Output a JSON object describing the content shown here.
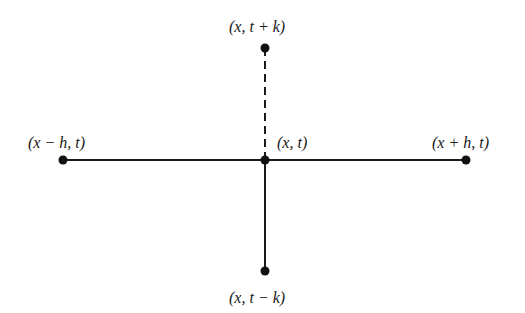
{
  "diagram": {
    "title": "",
    "style": {
      "line_color": "#1a1a1a",
      "dot_color": "#111111",
      "background": "#ffffff"
    },
    "nodes": [
      {
        "id": "center",
        "label": "(x, t)",
        "x": 265,
        "y": 160,
        "label_x": 277,
        "label_y": 135
      },
      {
        "id": "left",
        "label": "(x − h, t)",
        "x": 63,
        "y": 160,
        "label_x": 28,
        "label_y": 135
      },
      {
        "id": "right",
        "label": "(x + h, t)",
        "x": 466,
        "y": 160,
        "label_x": 432,
        "label_y": 135
      },
      {
        "id": "top",
        "label": "(x, t + k)",
        "x": 265,
        "y": 48,
        "label_x": 229,
        "label_y": 19
      },
      {
        "id": "bottom",
        "label": "(x, t − k)",
        "x": 265,
        "y": 271,
        "label_x": 229,
        "label_y": 290
      }
    ],
    "edges": [
      {
        "from": "left",
        "to": "center",
        "style": "solid"
      },
      {
        "from": "center",
        "to": "right",
        "style": "solid"
      },
      {
        "from": "center",
        "to": "bottom",
        "style": "solid"
      },
      {
        "from": "center",
        "to": "top",
        "style": "dashed"
      }
    ],
    "labels": {
      "center": "(x, t)",
      "left": "(x − h, t)",
      "right": "(x + h, t)",
      "top": "(x, t + k)",
      "bottom": "(x, t − k)"
    }
  }
}
